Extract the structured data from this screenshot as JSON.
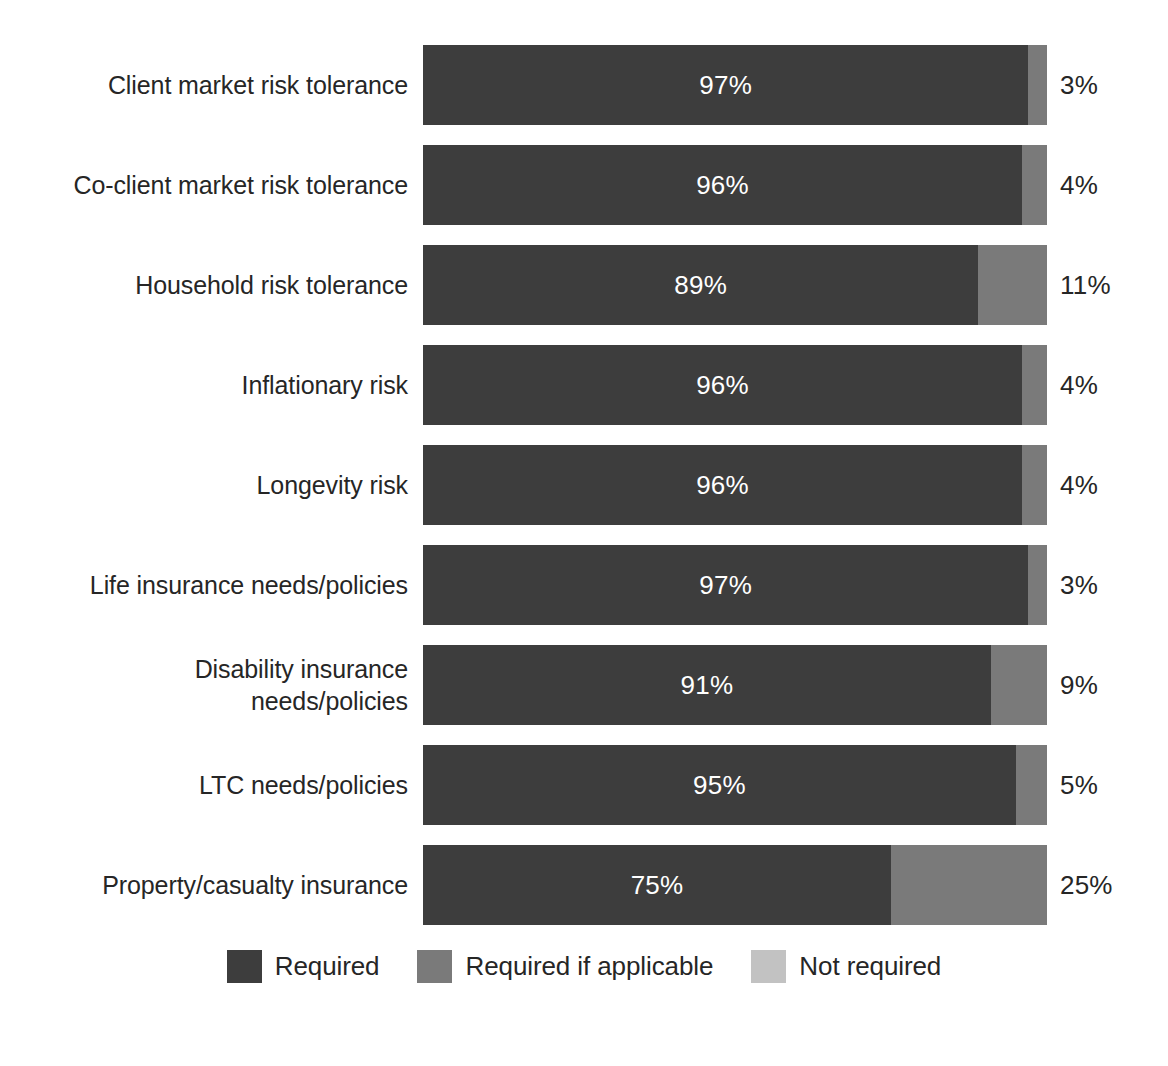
{
  "chart_data": {
    "type": "bar",
    "orientation": "horizontal",
    "stacked": true,
    "stacked_percent": true,
    "title": "",
    "xlabel": "",
    "ylabel": "",
    "xlim": [
      0,
      100
    ],
    "grid": false,
    "legend_position": "bottom",
    "categories": [
      "Client market risk tolerance",
      "Co-client market risk tolerance",
      "Household risk tolerance",
      "Inflationary risk",
      "Longevity risk",
      "Life insurance needs/policies",
      "Disability insurance\nneeds/policies",
      "LTC needs/policies",
      "Property/casualty insurance"
    ],
    "series": [
      {
        "name": "Required",
        "color": "#3d3d3d",
        "values": [
          97,
          96,
          89,
          96,
          96,
          97,
          91,
          95,
          75
        ]
      },
      {
        "name": "Required if applicable",
        "color": "#7a7a7a",
        "values": [
          3,
          4,
          11,
          4,
          4,
          3,
          9,
          5,
          25
        ]
      },
      {
        "name": "Not required",
        "color": "#c2c2c2",
        "values": [
          0,
          0,
          0,
          0,
          0,
          0,
          0,
          0,
          0
        ]
      }
    ],
    "inside_labels": [
      "97%",
      "96%",
      "89%",
      "96%",
      "96%",
      "97%",
      "91%",
      "95%",
      "75%"
    ],
    "outside_labels": [
      "3%",
      "4%",
      "11%",
      "4%",
      "4%",
      "3%",
      "9%",
      "5%",
      "25%"
    ]
  },
  "legend": {
    "items": [
      {
        "label": "Required",
        "color": "#3d3d3d"
      },
      {
        "label": "Required if applicable",
        "color": "#7a7a7a"
      },
      {
        "label": "Not required",
        "color": "#c2c2c2"
      }
    ]
  }
}
